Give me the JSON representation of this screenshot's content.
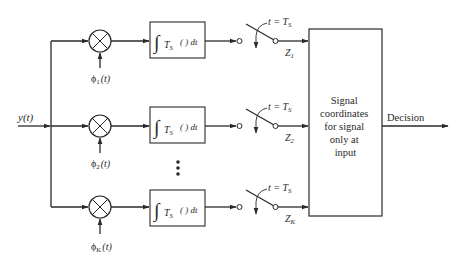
{
  "diagram": {
    "type": "block-diagram",
    "input": {
      "label": "y(t)"
    },
    "branches": [
      {
        "id": 1,
        "basis_label": "ϕ",
        "basis_sub": "1",
        "basis_arg": "(t)",
        "integrator": {
          "int_sub": "S",
          "int_var": "T",
          "body": "( ) dt"
        },
        "switch": {
          "label_pre": "t = T",
          "label_sub": "S"
        },
        "output": {
          "label": "Z",
          "sub": "1"
        }
      },
      {
        "id": 2,
        "basis_label": "ϕ",
        "basis_sub": "2",
        "basis_arg": "(t)",
        "integrator": {
          "int_sub": "S",
          "int_var": "T",
          "body": "( ) dt"
        },
        "switch": {
          "label_pre": "t = T",
          "label_sub": "S"
        },
        "output": {
          "label": "Z",
          "sub": "2"
        }
      },
      {
        "id": "K",
        "basis_label": "ϕ",
        "basis_sub": "K",
        "basis_arg": "(t)",
        "integrator": {
          "int_sub": "S",
          "int_var": "T",
          "body": "( ) dt"
        },
        "switch": {
          "label_pre": "t = T",
          "label_sub": "S"
        },
        "output": {
          "label": "Z",
          "sub": "K"
        }
      }
    ],
    "ellipsis": "⋮",
    "decision_block": {
      "lines": [
        "Signal",
        "coordinates",
        "for signal",
        "only at",
        "input"
      ]
    },
    "output": {
      "label": "Decision"
    },
    "colors": {
      "stroke": "#2a2a2a",
      "background": "#ffffff"
    }
  }
}
